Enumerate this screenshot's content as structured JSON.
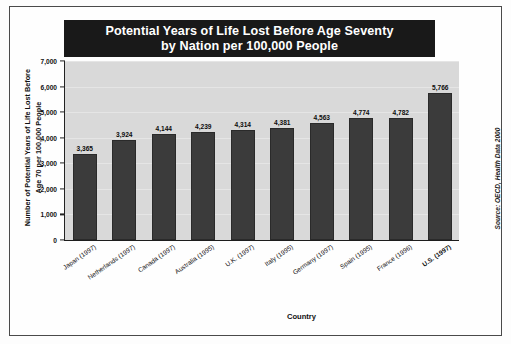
{
  "chart_data": {
    "type": "bar",
    "title": "Potential Years of Life Lost Before Age Seventy by Nation per 100,000 People",
    "title_line1": "Potential Years of Life Lost Before Age Seventy",
    "title_line2": "by Nation per 100,000 People",
    "xlabel": "Country",
    "ylabel": "Number of Potential Years of Life Lost Before Age 70 per 100,000 People",
    "ylabel_line1": "Number of Potential Years of Life Lost Before",
    "ylabel_line2": "Age 70 per 100,000 People",
    "source": "Source: OECD, Health Data 2000",
    "ylim": [
      0,
      7000
    ],
    "yticks": [
      "0",
      "1,000",
      "2,000",
      "3,000",
      "4,000",
      "5,000",
      "6,000",
      "7,000"
    ],
    "ytick_values": [
      0,
      1000,
      2000,
      3000,
      4000,
      5000,
      6000,
      7000
    ],
    "grid": true,
    "legend": "none",
    "categories": [
      "Japan (1997)",
      "Netherlands (1997)",
      "Canada (1997)",
      "Australia (1995)",
      "U.K. (1997)",
      "Italy (1995)",
      "Germany (1997)",
      "Spain (1995)",
      "France (1996)",
      "U.S. (1997)"
    ],
    "values": [
      3365,
      3924,
      4144,
      4239,
      4314,
      4381,
      4563,
      4774,
      4782,
      5766
    ],
    "value_labels": [
      "3,365",
      "3,924",
      "4,144",
      "4,239",
      "4,314",
      "4,381",
      "4,563",
      "4,774",
      "4,782",
      "5,766"
    ],
    "highlight_index": 9,
    "colors": {
      "bar": "#3b3b3b",
      "plot_background": "#d9d9d9",
      "title_background": "#191919",
      "title_text": "#ffffff",
      "axis": "#1d1d1d",
      "page_background": "#ffffff"
    }
  }
}
